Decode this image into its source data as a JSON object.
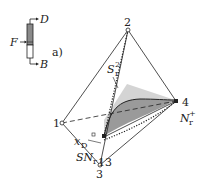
{
  "figure": {
    "panel_label": "a)",
    "column": {
      "top_stream": "D",
      "feed_stream": "F",
      "bottom_stream": "B"
    },
    "tetrahedron": {
      "vertices": [
        {
          "id": "1",
          "label": "1"
        },
        {
          "id": "2",
          "label": "2"
        },
        {
          "id": "3",
          "label": "3"
        },
        {
          "id": "4",
          "label": "4"
        }
      ],
      "labels": {
        "s_r_2": {
          "main": "S",
          "sup": "2",
          "sub": "r"
        },
        "n_r_plus": {
          "main": "N",
          "sup": "+",
          "sub": "r"
        },
        "x_d": {
          "main": "x",
          "sub": "D"
        },
        "sn_r": {
          "main": "SN",
          "sub": "r"
        },
        "node_13": "13"
      }
    },
    "colors": {
      "line": "#222222",
      "shade_dark": "#9a9a9a",
      "shade_light": "#d4d4d4",
      "column_fill": "#8a8a8a"
    }
  }
}
